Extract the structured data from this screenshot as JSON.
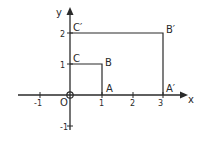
{
  "diagram": {
    "axes": {
      "x_label": "x",
      "y_label": "y",
      "origin_label": "O",
      "x_ticks": [
        {
          "value": -1,
          "label": "-1"
        },
        {
          "value": 1,
          "label": "1"
        },
        {
          "value": 2,
          "label": "2"
        },
        {
          "value": 3,
          "label": "3"
        }
      ],
      "y_ticks": [
        {
          "value": 1,
          "label": "1"
        },
        {
          "value": 2,
          "label": "2"
        },
        {
          "value": -1,
          "label": "-1"
        }
      ]
    },
    "small_rectangle": {
      "vertices": [
        {
          "label": "O",
          "x": 0,
          "y": 0
        },
        {
          "label": "A",
          "x": 1,
          "y": 0
        },
        {
          "label": "B",
          "x": 1,
          "y": 1
        },
        {
          "label": "C",
          "x": 0,
          "y": 1
        }
      ]
    },
    "large_rectangle": {
      "vertices": [
        {
          "label": "O",
          "x": 0,
          "y": 0
        },
        {
          "label": "A′",
          "x": 3,
          "y": 0
        },
        {
          "label": "B′",
          "x": 3,
          "y": 2
        },
        {
          "label": "C′",
          "x": 0,
          "y": 2
        }
      ]
    },
    "labels": {
      "A": "A",
      "B": "B",
      "C": "C",
      "A_prime": "A′",
      "B_prime": "B′",
      "C_prime": "C′"
    },
    "colors": {
      "stroke": "#2a2a2a",
      "background": "#ffffff"
    }
  }
}
